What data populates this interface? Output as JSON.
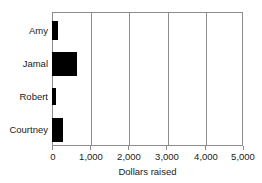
{
  "chart_data": {
    "type": "bar",
    "orientation": "horizontal",
    "title": "",
    "xlabel": "Dollars raised",
    "ylabel": "",
    "categories": [
      "Amy",
      "Jamal",
      "Robert",
      "Courtney"
    ],
    "values": [
      150,
      650,
      100,
      300
    ],
    "series": [
      {
        "name": "Dollars raised",
        "values": [
          150,
          650,
          100,
          300
        ]
      }
    ],
    "xlim": [
      0,
      5000
    ],
    "xticks": [
      0,
      1000,
      2000,
      3000,
      4000,
      5000
    ],
    "xtick_labels": [
      "0",
      "1,000",
      "2,000",
      "3,000",
      "4,000",
      "5,000"
    ],
    "grid": "vertical",
    "legend": "none",
    "bar_color": "#000000",
    "frame_color": "#8c8c8c",
    "background": "#ffffff"
  }
}
